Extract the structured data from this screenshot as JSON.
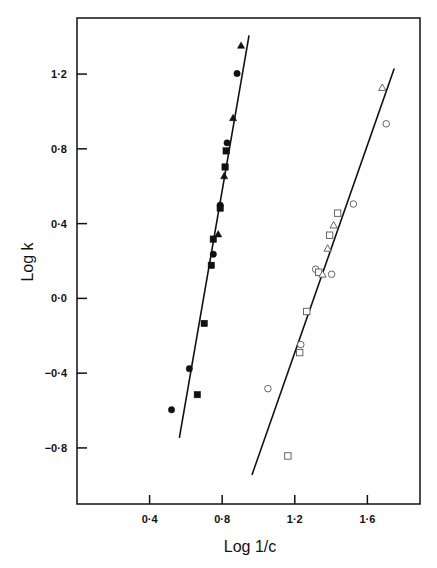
{
  "chart_data": {
    "type": "scatter",
    "title": "",
    "xlabel": "Log 1/c",
    "ylabel": "Log k",
    "xlim": [
      0.0,
      1.89
    ],
    "ylim": [
      -1.1,
      1.5
    ],
    "grid": false,
    "legend": null,
    "x_ticks": [
      {
        "value": 0.4,
        "label": "0·4"
      },
      {
        "value": 0.8,
        "label": "0·8"
      },
      {
        "value": 1.2,
        "label": "1·2"
      },
      {
        "value": 1.6,
        "label": "1·6"
      }
    ],
    "y_ticks": [
      {
        "value": 1.2,
        "label": "1·2"
      },
      {
        "value": 0.8,
        "label": "0·8"
      },
      {
        "value": 0.4,
        "label": "0·4"
      },
      {
        "value": 0.0,
        "label": "0·0"
      },
      {
        "value": -0.4,
        "label": "−0·4"
      },
      {
        "value": -0.8,
        "label": "−0·8"
      }
    ],
    "series": [
      {
        "name": "filled-symbols",
        "filled": true,
        "color": "#111111",
        "fit_line": {
          "x": [
            0.564,
            0.948
          ],
          "y": [
            -0.746,
            1.407
          ]
        },
        "points": [
          {
            "x": 0.904,
            "y": 1.353,
            "marker": "triangle"
          },
          {
            "x": 0.882,
            "y": 1.203,
            "marker": "circle"
          },
          {
            "x": 0.86,
            "y": 0.966,
            "marker": "triangle"
          },
          {
            "x": 0.827,
            "y": 0.832,
            "marker": "circle"
          },
          {
            "x": 0.822,
            "y": 0.789,
            "marker": "square"
          },
          {
            "x": 0.816,
            "y": 0.703,
            "marker": "square"
          },
          {
            "x": 0.811,
            "y": 0.655,
            "marker": "triangle"
          },
          {
            "x": 0.789,
            "y": 0.499,
            "marker": "circle"
          },
          {
            "x": 0.789,
            "y": 0.483,
            "marker": "square"
          },
          {
            "x": 0.778,
            "y": 0.344,
            "marker": "triangle"
          },
          {
            "x": 0.751,
            "y": 0.317,
            "marker": "square"
          },
          {
            "x": 0.751,
            "y": 0.236,
            "marker": "circle"
          },
          {
            "x": 0.74,
            "y": 0.177,
            "marker": "square"
          },
          {
            "x": 0.701,
            "y": -0.134,
            "marker": "square"
          },
          {
            "x": 0.619,
            "y": -0.376,
            "marker": "circle"
          },
          {
            "x": 0.663,
            "y": -0.515,
            "marker": "square"
          },
          {
            "x": 0.521,
            "y": -0.596,
            "marker": "circle"
          }
        ]
      },
      {
        "name": "open-symbols",
        "filled": false,
        "color": "#555555",
        "fit_line": {
          "x": [
            0.964,
            1.748
          ],
          "y": [
            -0.945,
            1.23
          ]
        },
        "points": [
          {
            "x": 1.682,
            "y": 1.128,
            "marker": "triangle"
          },
          {
            "x": 1.704,
            "y": 0.934,
            "marker": "circle"
          },
          {
            "x": 1.523,
            "y": 0.505,
            "marker": "circle"
          },
          {
            "x": 1.436,
            "y": 0.456,
            "marker": "square"
          },
          {
            "x": 1.414,
            "y": 0.392,
            "marker": "triangle"
          },
          {
            "x": 1.392,
            "y": 0.338,
            "marker": "square"
          },
          {
            "x": 1.381,
            "y": 0.268,
            "marker": "triangle"
          },
          {
            "x": 1.315,
            "y": 0.156,
            "marker": "circle"
          },
          {
            "x": 1.332,
            "y": 0.14,
            "marker": "square"
          },
          {
            "x": 1.353,
            "y": 0.129,
            "marker": "triangle"
          },
          {
            "x": 1.403,
            "y": 0.129,
            "marker": "circle"
          },
          {
            "x": 1.266,
            "y": -0.07,
            "marker": "square"
          },
          {
            "x": 1.233,
            "y": -0.247,
            "marker": "circle"
          },
          {
            "x": 1.227,
            "y": -0.29,
            "marker": "square"
          },
          {
            "x": 1.052,
            "y": -0.483,
            "marker": "circle"
          },
          {
            "x": 1.162,
            "y": -0.843,
            "marker": "square"
          }
        ]
      }
    ]
  }
}
